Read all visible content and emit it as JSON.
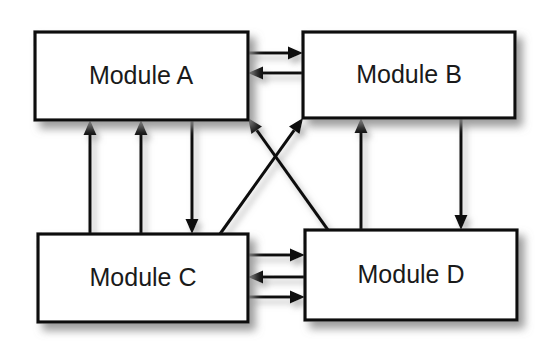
{
  "diagram": {
    "background_color": "#ffffff",
    "line_color": "#101010",
    "box_fill_color": "#ffffff",
    "text_color": "#1a1a1a",
    "shadow_color": "#8c8c8c",
    "width": 558,
    "height": 351
  },
  "nodes": [
    {
      "id": "module-a",
      "label": "Module A",
      "x": 35,
      "y": 32,
      "width": 213,
      "height": 88,
      "center_x": 141,
      "center_y": 76
    },
    {
      "id": "module-b",
      "label": "Module B",
      "x": 303,
      "y": 32,
      "width": 212,
      "height": 86,
      "center_x": 409,
      "center_y": 75
    },
    {
      "id": "module-c",
      "label": "Module C",
      "x": 38,
      "y": 234,
      "width": 210,
      "height": 88,
      "center_x": 143,
      "center_y": 278
    },
    {
      "id": "module-d",
      "label": "Module D",
      "x": 305,
      "y": 230,
      "width": 212,
      "height": 90,
      "center_x": 411,
      "center_y": 275
    }
  ],
  "edges": [
    {
      "id": "edge-a-to-b",
      "from": "module-a",
      "to": "module-b",
      "direction": "right",
      "kind": "horizontal",
      "x1": 248,
      "y1": 53,
      "x2": 303,
      "y2": 53
    },
    {
      "id": "edge-b-to-a",
      "from": "module-b",
      "to": "module-a",
      "direction": "left",
      "kind": "horizontal",
      "x1": 303,
      "y1": 73,
      "x2": 248,
      "y2": 73
    },
    {
      "id": "edge-c-to-a-left",
      "from": "module-c",
      "to": "module-a",
      "direction": "up",
      "kind": "vertical",
      "x1": 90,
      "y1": 234,
      "x2": 90,
      "y2": 120
    },
    {
      "id": "edge-c-to-a-mid",
      "from": "module-c",
      "to": "module-a",
      "direction": "up",
      "kind": "vertical",
      "x1": 141,
      "y1": 234,
      "x2": 141,
      "y2": 120
    },
    {
      "id": "edge-a-to-c",
      "from": "module-a",
      "to": "module-c",
      "direction": "down",
      "kind": "vertical",
      "x1": 192,
      "y1": 120,
      "x2": 192,
      "y2": 234
    },
    {
      "id": "edge-d-to-b",
      "from": "module-d",
      "to": "module-b",
      "direction": "up",
      "kind": "vertical",
      "x1": 361,
      "y1": 230,
      "x2": 361,
      "y2": 118
    },
    {
      "id": "edge-b-to-d",
      "from": "module-b",
      "to": "module-d",
      "direction": "down",
      "kind": "vertical",
      "x1": 461,
      "y1": 118,
      "x2": 461,
      "y2": 230
    },
    {
      "id": "edge-c-to-b",
      "from": "module-c",
      "to": "module-b",
      "direction": "up-right",
      "kind": "diagonal",
      "x1": 220,
      "y1": 234,
      "x2": 303,
      "y2": 118
    },
    {
      "id": "edge-d-to-a",
      "from": "module-d",
      "to": "module-a",
      "direction": "up-left",
      "kind": "diagonal",
      "x1": 328,
      "y1": 230,
      "x2": 248,
      "y2": 118
    },
    {
      "id": "edge-c-to-d-top",
      "from": "module-c",
      "to": "module-d",
      "direction": "right",
      "kind": "horizontal",
      "x1": 248,
      "y1": 255,
      "x2": 305,
      "y2": 255
    },
    {
      "id": "edge-d-to-c",
      "from": "module-d",
      "to": "module-c",
      "direction": "left",
      "kind": "horizontal",
      "x1": 305,
      "y1": 277,
      "x2": 248,
      "y2": 277
    },
    {
      "id": "edge-c-to-d-bottom",
      "from": "module-c",
      "to": "module-d",
      "direction": "right",
      "kind": "horizontal",
      "x1": 248,
      "y1": 297,
      "x2": 305,
      "y2": 297
    }
  ]
}
